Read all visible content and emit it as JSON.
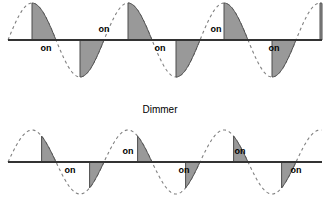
{
  "figure": {
    "background_color": "#ffffff",
    "width": 334,
    "height": 209
  },
  "style": {
    "shade_fill": "#999999",
    "shade_stroke": "#4d4d4d",
    "axis_color": "#333333",
    "sine_color": "#808080",
    "text_color": "#000000",
    "dash_pattern": "3,3"
  },
  "titles": {
    "dimmer_label": "Dimmer"
  },
  "waveforms": [
    {
      "name": "full-brightness-waveform",
      "baseline_y": 40,
      "amplitude": 37,
      "period": 96,
      "x_start": 8,
      "x_end": 322,
      "firing_angle_deg": 90,
      "description": "Phase-controlled AC waveform with conduction beginning at the peak of each half cycle",
      "on_labels": [
        {
          "text": "on",
          "x": 46,
          "y": 51
        },
        {
          "text": "on",
          "x": 104,
          "y": 32
        },
        {
          "text": "on",
          "x": 160,
          "y": 51
        },
        {
          "text": "on",
          "x": 216,
          "y": 32
        },
        {
          "text": "on",
          "x": 274,
          "y": 51
        }
      ]
    },
    {
      "name": "dimmer-waveform",
      "baseline_y": 162,
      "amplitude": 32,
      "period": 96,
      "x_start": 8,
      "x_end": 322,
      "firing_angle_deg": 126,
      "description": "Phase-controlled AC waveform with later triggering producing a smaller conduction area",
      "on_labels": [
        {
          "text": "on",
          "x": 70,
          "y": 173
        },
        {
          "text": "on",
          "x": 128,
          "y": 154
        },
        {
          "text": "on",
          "x": 184,
          "y": 173
        },
        {
          "text": "on",
          "x": 240,
          "y": 154
        },
        {
          "text": "on",
          "x": 296,
          "y": 173
        }
      ]
    }
  ],
  "chart_data": {
    "type": "line",
    "title": "Dimmer",
    "xlabel": "",
    "ylabel": "",
    "series": [
      {
        "name": "full-brightness-waveform",
        "waveform": "sine",
        "period": 96,
        "amplitude": 37,
        "baseline_y": 40,
        "firing_angle_deg": 90,
        "conduction_angle_deg": 90,
        "annotations": [
          "on",
          "on",
          "on",
          "on",
          "on"
        ]
      },
      {
        "name": "dimmer-waveform",
        "waveform": "sine",
        "period": 96,
        "amplitude": 32,
        "baseline_y": 162,
        "firing_angle_deg": 126,
        "conduction_angle_deg": 54,
        "annotations": [
          "on",
          "on",
          "on",
          "on",
          "on"
        ]
      }
    ]
  }
}
